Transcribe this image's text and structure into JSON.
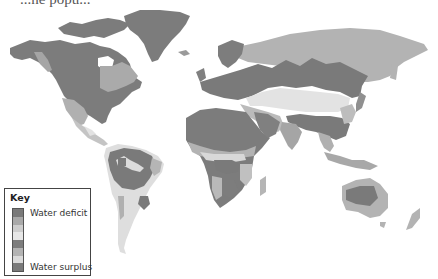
{
  "header": {
    "partial_text": "...ne popu..."
  },
  "map": {
    "title": "World water balance map",
    "colors": {
      "deficit_dark": "#7a7a7a",
      "deficit_mid": "#a8a8a8",
      "deficit_light": "#cfcfcf",
      "neutral": "#e8e8e8",
      "surplus_dark": "#808080",
      "surplus_mid": "#b5b5b5",
      "surplus_light": "#dcdcdc",
      "surplus_max": "#7c7c7c"
    }
  },
  "key": {
    "title": "Key",
    "top_label": "Water deficit",
    "bottom_label": "Water surplus",
    "bands": [
      "#7a7a7a",
      "#a9a9a9",
      "#cdcdcd",
      "#e6e6e6",
      "#7d7d7d",
      "#b3b3b3",
      "#dadada",
      "#7a7a7a"
    ]
  }
}
